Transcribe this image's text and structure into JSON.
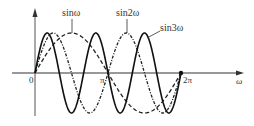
{
  "chart_data": {
    "type": "line",
    "title": "",
    "xlabel": "ω",
    "ylabel": "",
    "x_ticks": [
      "0",
      "π",
      "2π"
    ],
    "x_range": [
      0,
      6.2832
    ],
    "y_range": [
      -1,
      1
    ],
    "grid": false,
    "legend": "inline annotations",
    "series": [
      {
        "name": "sinω",
        "style": "dashed",
        "function": "sin(x)",
        "x": [
          0,
          1.5708,
          3.1416,
          4.7124,
          6.2832
        ],
        "values": [
          0,
          1,
          0,
          -1,
          0
        ]
      },
      {
        "name": "sin2ω",
        "style": "dash-dot",
        "function": "sin(2x)",
        "x": [
          0,
          0.7854,
          1.5708,
          2.3562,
          3.1416,
          3.927,
          4.7124,
          5.4978,
          6.2832
        ],
        "values": [
          0,
          1,
          0,
          -1,
          0,
          1,
          0,
          -1,
          0
        ]
      },
      {
        "name": "sin3ω",
        "style": "solid",
        "function": "sin(3x)",
        "x": [
          0,
          0.5236,
          1.0472,
          1.5708,
          2.0944,
          2.618,
          3.1416,
          3.6652,
          4.1888,
          4.7124,
          5.236,
          5.7596,
          6.2832
        ],
        "values": [
          0,
          1,
          0,
          -1,
          0,
          1,
          0,
          -1,
          0,
          1,
          0,
          -1,
          0
        ]
      }
    ]
  },
  "labels": {
    "origin": "0",
    "pi": "π",
    "two_pi": "2π",
    "x_axis": "ω",
    "sin1": "sinω",
    "sin2": "sin2ω",
    "sin3": "sin3ω"
  },
  "colors": {
    "line": "#222222",
    "axis": "#333333"
  }
}
